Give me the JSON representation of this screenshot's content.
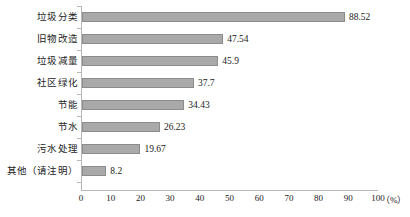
{
  "chart_data": {
    "type": "bar",
    "orientation": "horizontal",
    "title": "",
    "subtitle": "",
    "xlabel": "(%)",
    "ylabel": "",
    "categories": [
      "垃圾分类",
      "旧物改造",
      "垃圾减量",
      "社区绿化",
      "节能",
      "节水",
      "污水处理",
      "其他（请注明）"
    ],
    "values": [
      88.52,
      47.54,
      45.9,
      37.7,
      34.43,
      26.23,
      19.67,
      8.2
    ],
    "value_labels": [
      "88.52",
      "47.54",
      "45.9",
      "37.7",
      "34.43",
      "26.23",
      "19.67",
      "8.2"
    ],
    "xlim": [
      0,
      100
    ],
    "xticks": [
      0,
      10,
      20,
      30,
      40,
      50,
      60,
      70,
      80,
      90,
      100
    ],
    "xtick_labels": [
      "0",
      "10",
      "20",
      "30",
      "40",
      "50",
      "60",
      "70",
      "80",
      "90",
      "100"
    ],
    "unit_label": "（%）",
    "grid": false,
    "legend": null,
    "series": [
      {
        "name": "",
        "values": [
          88.52,
          47.54,
          45.9,
          37.7,
          34.43,
          26.23,
          19.67,
          8.2
        ]
      }
    ],
    "colors": {
      "bar_fill": "#a9a9a9",
      "bar_border": "#8c8c8c",
      "axis": "#b7b7b7",
      "text": "#1a1a1a",
      "background": "#ffffff"
    }
  }
}
